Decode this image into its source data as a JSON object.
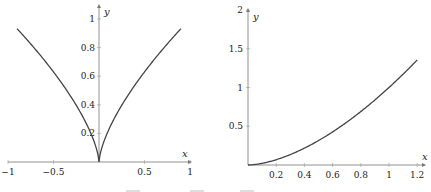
{
  "chart_data": [
    {
      "type": "line",
      "title": "",
      "xlabel": "x",
      "ylabel": "y",
      "function": "y = |x|^(2/3)",
      "xlim": [
        -1,
        1
      ],
      "ylim": [
        0,
        1.05
      ],
      "x_ticks": [
        "-1",
        "-0.5",
        "0.5",
        "1"
      ],
      "y_ticks": [
        "0.2",
        "0.4",
        "0.6",
        "0.8",
        "1"
      ],
      "grid": false,
      "series": [
        {
          "name": "curve",
          "x": [
            -0.9,
            -0.8,
            -0.6,
            -0.4,
            -0.2,
            -0.1,
            -0.02,
            0,
            0.02,
            0.1,
            0.2,
            0.4,
            0.6,
            0.8,
            0.9
          ],
          "y": [
            0.93,
            0.86,
            0.71,
            0.54,
            0.34,
            0.22,
            0.07,
            0,
            0.07,
            0.22,
            0.34,
            0.54,
            0.71,
            0.86,
            0.93
          ]
        }
      ]
    },
    {
      "type": "line",
      "title": "",
      "xlabel": "x",
      "ylabel": "y",
      "function": "y = x^(5/3)",
      "xlim": [
        0,
        1.25
      ],
      "ylim": [
        0,
        2
      ],
      "x_ticks": [
        "0.2",
        "0.4",
        "0.6",
        "0.8",
        "1",
        "1.2"
      ],
      "y_ticks": [
        "0.5",
        "1",
        "1.5",
        "2"
      ],
      "grid": false,
      "series": [
        {
          "name": "curve",
          "x": [
            0,
            0.2,
            0.4,
            0.6,
            0.8,
            1.0,
            1.2
          ],
          "y": [
            0,
            0.07,
            0.22,
            0.43,
            0.69,
            1.0,
            1.36
          ]
        }
      ]
    }
  ],
  "plots": {
    "left": {
      "xlabel": "x",
      "ylabel": "y",
      "x_ticks": [
        "−1",
        "−0.5",
        "0.5",
        "1"
      ],
      "y_ticks": [
        "0.2",
        "0.4",
        "0.6",
        "0.8",
        "1"
      ]
    },
    "right": {
      "xlabel": "x",
      "ylabel": "y",
      "x_ticks": [
        "0.2",
        "0.4",
        "0.6",
        "0.8",
        "1",
        "1.2"
      ],
      "y_ticks": [
        "0.5",
        "1",
        "1.5",
        "2"
      ]
    }
  },
  "colors": {
    "curve": "#444444",
    "axis": "#777777"
  }
}
